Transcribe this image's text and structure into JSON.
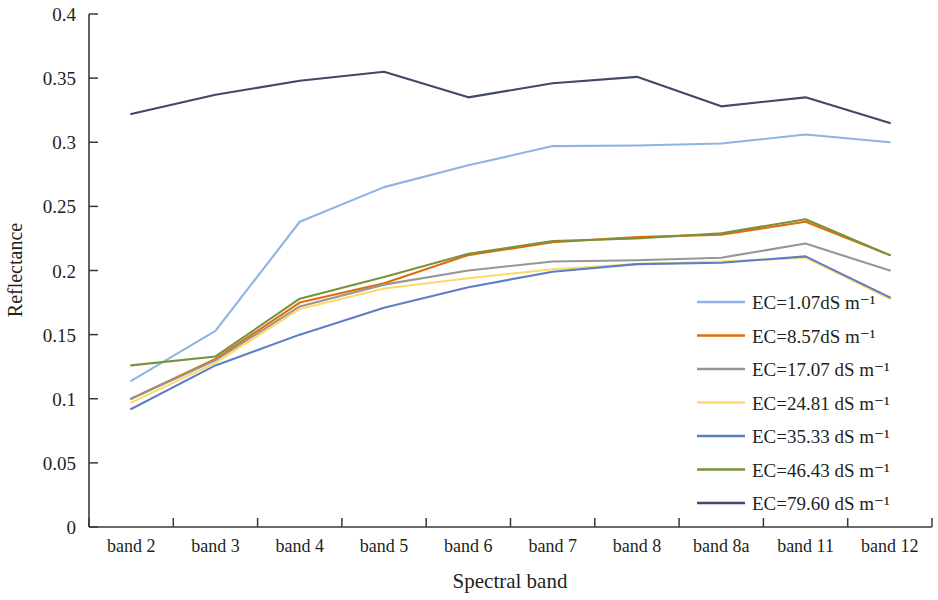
{
  "chart_data": {
    "type": "line",
    "title": "",
    "xlabel": "Spectral band",
    "ylabel": "Reflectance",
    "categories": [
      "band 2",
      "band 3",
      "band 4",
      "band 5",
      "band 6",
      "band 7",
      "band 8",
      "band 8a",
      "band 11",
      "band 12"
    ],
    "ylim": [
      0,
      0.4
    ],
    "yticks": [
      0,
      0.05,
      0.1,
      0.15,
      0.2,
      0.25,
      0.3,
      0.35,
      0.4
    ],
    "ytick_labels": [
      "0",
      "0.05",
      "0.1",
      "0.15",
      "0.2",
      "0.25",
      "0.3",
      "0.35",
      "0.4"
    ],
    "grid": false,
    "legend_position": "inside-right-lower",
    "series": [
      {
        "name": "EC=1.07dS m⁻¹",
        "color": "#8eb4e3",
        "values": [
          0.114,
          0.153,
          0.238,
          0.265,
          0.282,
          0.297,
          0.2975,
          0.299,
          0.306,
          0.3
        ]
      },
      {
        "name": "EC=8.57dS m⁻¹",
        "color": "#e36c09",
        "values": [
          0.1,
          0.131,
          0.175,
          0.19,
          0.212,
          0.222,
          0.226,
          0.228,
          0.238,
          0.212
        ]
      },
      {
        "name": "EC=17.07 dS m⁻¹",
        "color": "#969696",
        "values": [
          0.1,
          0.13,
          0.172,
          0.189,
          0.2,
          0.207,
          0.208,
          0.21,
          0.221,
          0.2
        ]
      },
      {
        "name": "EC=24.81 dS m⁻¹",
        "color": "#ffd966",
        "values": [
          0.097,
          0.128,
          0.17,
          0.186,
          0.194,
          0.201,
          0.205,
          0.207,
          0.21,
          0.178
        ]
      },
      {
        "name": "EC=35.33 dS m⁻¹",
        "color": "#5b7fc7",
        "values": [
          0.092,
          0.126,
          0.15,
          0.171,
          0.187,
          0.199,
          0.205,
          0.206,
          0.211,
          0.179
        ]
      },
      {
        "name": "EC=46.43 dS m⁻¹",
        "color": "#77933c",
        "values": [
          0.126,
          0.133,
          0.178,
          0.195,
          0.213,
          0.223,
          0.225,
          0.229,
          0.24,
          0.212
        ]
      },
      {
        "name": "EC=79.60 dS m⁻¹",
        "color": "#40486b",
        "values": [
          0.322,
          0.337,
          0.348,
          0.355,
          0.335,
          0.346,
          0.351,
          0.328,
          0.335,
          0.315
        ]
      }
    ]
  },
  "axes": {
    "y_title": "Reflectance",
    "x_title": "Spectral band"
  }
}
